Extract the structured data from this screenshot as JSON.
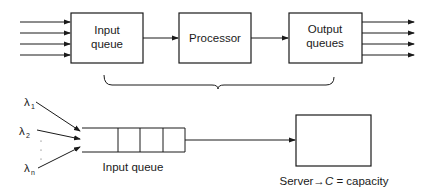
{
  "top_diagram": {
    "blocks": [
      {
        "id": "input",
        "lines": [
          "Input",
          "queue"
        ]
      },
      {
        "id": "processor",
        "lines": [
          "Processor"
        ]
      },
      {
        "id": "output",
        "lines": [
          "Output",
          "queues"
        ]
      }
    ],
    "input_arrow_count": 4,
    "output_arrow_count": 4
  },
  "bottom_diagram": {
    "arrivals": [
      {
        "symbol": "λ",
        "subscript": "1"
      },
      {
        "symbol": "λ",
        "subscript": "2"
      },
      {
        "symbol": "λ",
        "subscript": "n"
      }
    ],
    "queue_label": "Input queue",
    "queue_cells": 4,
    "server_caption": "Server→C = capacity",
    "server_caption_parts": {
      "prefix": "Server→",
      "var": "C",
      "suffix": " = capacity"
    }
  },
  "colors": {
    "stroke": "#1a1a1a",
    "background": "#ffffff"
  }
}
